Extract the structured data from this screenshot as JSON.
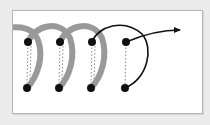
{
  "diagram": {
    "colors": {
      "background": "#ececec",
      "panel": "#ffffff",
      "panel_border": "#b5b5b5",
      "ribbon_gray": "#999999",
      "active_strand": "#111111",
      "node": "#111111",
      "rung": "#888888"
    },
    "columns": [
      {
        "top": [
          28,
          42
        ],
        "bottom": [
          27,
          88
        ],
        "strand": "gray"
      },
      {
        "top": [
          60,
          42
        ],
        "bottom": [
          59,
          88
        ],
        "strand": "gray"
      },
      {
        "top": [
          92,
          42
        ],
        "bottom": [
          91,
          88
        ],
        "strand": "gray"
      },
      {
        "top": [
          126,
          42
        ],
        "bottom": [
          125,
          88
        ],
        "strand": "black"
      }
    ],
    "arrow": {
      "from": [
        126,
        42
      ],
      "to": [
        180,
        30
      ]
    }
  }
}
